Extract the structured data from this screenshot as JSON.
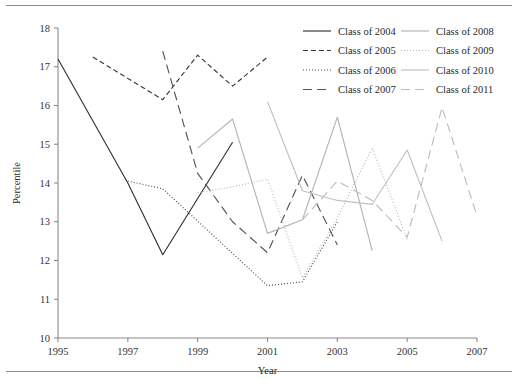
{
  "chart_data": {
    "type": "line",
    "title": "",
    "xlabel": "Year",
    "ylabel": "Percentile",
    "xlim": [
      1995,
      2007
    ],
    "ylim": [
      10,
      18
    ],
    "xticks": [
      1995,
      1997,
      1999,
      2001,
      2003,
      2005,
      2007
    ],
    "yticks": [
      10,
      11,
      12,
      13,
      14,
      15,
      16,
      17,
      18
    ],
    "grid": false,
    "legend_position": "top-right",
    "legend_columns": 2,
    "series": [
      {
        "name": "Class of 2004",
        "style": "solid",
        "color": "#333333",
        "x": [
          1995,
          1997,
          1998,
          2000
        ],
        "values": [
          17.2,
          14.0,
          12.15,
          15.05
        ]
      },
      {
        "name": "Class of 2005",
        "style": "dashed",
        "color": "#3a3a3a",
        "x": [
          1996,
          1998,
          1999,
          2000,
          2001
        ],
        "values": [
          17.25,
          16.15,
          17.3,
          16.5,
          17.25
        ]
      },
      {
        "name": "Class of 2006",
        "style": "dotted",
        "color": "#4a4a4a",
        "x": [
          1997,
          1998,
          2001,
          2002,
          2003
        ],
        "values": [
          14.05,
          13.85,
          11.35,
          11.45,
          13.0
        ]
      },
      {
        "name": "Class of 2007",
        "style": "long-dash",
        "color": "#555555",
        "x": [
          1998,
          1999,
          2000,
          2001,
          2002,
          2003
        ],
        "values": [
          17.4,
          14.25,
          13.0,
          12.2,
          14.2,
          12.4
        ]
      },
      {
        "name": "Class of 2008",
        "style": "solid",
        "color": "#b4b4b4",
        "x": [
          1999,
          2000,
          2001,
          2002,
          2003,
          2004
        ],
        "values": [
          14.9,
          15.65,
          12.7,
          13.05,
          15.7,
          12.25
        ]
      },
      {
        "name": "Class of 2009",
        "style": "dotted",
        "color": "#b8b8b8",
        "x": [
          1999,
          2000,
          2001,
          2002,
          2003,
          2004,
          2005
        ],
        "values": [
          13.75,
          13.9,
          14.1,
          11.55,
          13.1,
          14.9,
          12.55
        ]
      },
      {
        "name": "Class of 2010",
        "style": "solid",
        "color": "#c0c0c0",
        "x": [
          2001,
          2002,
          2003,
          2004,
          2005,
          2006
        ],
        "values": [
          16.1,
          13.8,
          13.55,
          13.45,
          14.85,
          12.5
        ]
      },
      {
        "name": "Class of 2011",
        "style": "long-dash",
        "color": "#bdbdbd",
        "x": [
          2002,
          2003,
          2004,
          2005,
          2006,
          2007
        ],
        "values": [
          13.05,
          14.05,
          13.55,
          12.6,
          15.95,
          13.15
        ]
      }
    ]
  },
  "axes": {
    "y_title": "Percentile",
    "x_title": "Year",
    "y_tick_labels": [
      "10",
      "11",
      "12",
      "13",
      "14",
      "15",
      "16",
      "17",
      "18"
    ],
    "x_tick_labels": [
      "1995",
      "1997",
      "1999",
      "2001",
      "2003",
      "2005",
      "2007"
    ]
  },
  "legend": {
    "column_1": [
      {
        "label": "Class of 2004",
        "style": "solid",
        "color": "#333333"
      },
      {
        "label": "Class of 2005",
        "style": "dashed",
        "color": "#3a3a3a"
      },
      {
        "label": "Class of 2006",
        "style": "dotted",
        "color": "#4a4a4a"
      },
      {
        "label": "Class of 2007",
        "style": "long-dash",
        "color": "#555555"
      }
    ],
    "column_2": [
      {
        "label": "Class of 2008",
        "style": "solid",
        "color": "#b4b4b4"
      },
      {
        "label": "Class of 2009",
        "style": "dotted",
        "color": "#b8b8b8"
      },
      {
        "label": "Class of 2010",
        "style": "solid",
        "color": "#c0c0c0"
      },
      {
        "label": "Class of 2011",
        "style": "long-dash",
        "color": "#bdbdbd"
      }
    ]
  }
}
